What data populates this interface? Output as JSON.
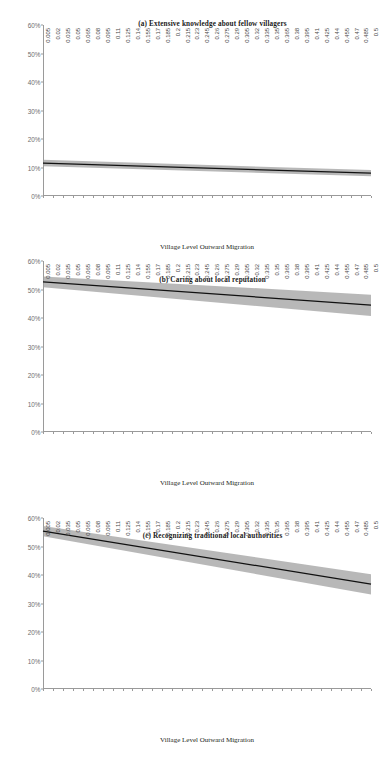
{
  "figure": {
    "panels": [
      {
        "id": "a",
        "title": "(a) Extensive knowledge about fellow villagers",
        "xlabel": "Village Level Outward Migration"
      },
      {
        "id": "b",
        "title": "(b) Caring about local reputation",
        "xlabel": "Village Level Outward Migration"
      },
      {
        "id": "c",
        "title": "(c) Recognizing traditional local authorities",
        "xlabel": "Village Level Outward Migration"
      }
    ],
    "yticks": [
      "0%",
      "10%",
      "20%",
      "30%",
      "40%",
      "50%",
      "60%"
    ],
    "xticks": [
      "0.005",
      "0.02",
      "0.035",
      "0.05",
      "0.065",
      "0.08",
      "0.095",
      "0.11",
      "0.125",
      "0.14",
      "0.155",
      "0.17",
      "0.185",
      "0.2",
      "0.215",
      "0.23",
      "0.245",
      "0.26",
      "0.275",
      "0.29",
      "0.305",
      "0.32",
      "0.335",
      "0.35",
      "0.365",
      "0.38",
      "0.395",
      "0.41",
      "0.425",
      "0.44",
      "0.455",
      "0.47",
      "0.485",
      "0.5"
    ],
    "colors": {
      "line": "#111111",
      "band": "#9d9d9d",
      "axis": "#9a9a9a",
      "tick_label": "#4a4a4a",
      "ytick_label": "#6d6d6d",
      "title": "#1a1a1a",
      "background": "#ffffff"
    }
  },
  "chart_data": [
    {
      "type": "line",
      "panel": "a",
      "title": "(a) Extensive knowledge about fellow villagers",
      "xlabel": "Village Level Outward Migration",
      "ylabel": "",
      "xlim": [
        0.005,
        0.5
      ],
      "ylim": [
        0,
        60
      ],
      "y_unit": "percent",
      "yticks": [
        0,
        10,
        20,
        30,
        40,
        50,
        60
      ],
      "xticks": [
        0.005,
        0.02,
        0.035,
        0.05,
        0.065,
        0.08,
        0.095,
        0.11,
        0.125,
        0.14,
        0.155,
        0.17,
        0.185,
        0.2,
        0.215,
        0.23,
        0.245,
        0.26,
        0.275,
        0.29,
        0.305,
        0.32,
        0.335,
        0.35,
        0.365,
        0.38,
        0.395,
        0.41,
        0.425,
        0.44,
        0.455,
        0.47,
        0.485,
        0.5
      ],
      "grid": false,
      "legend": "none",
      "series": [
        {
          "name": "Predicted probability",
          "x": [
            0.005,
            0.5
          ],
          "values": [
            11.5,
            8.0
          ]
        },
        {
          "name": "95% confidence interval upper",
          "x": [
            0.005,
            0.5
          ],
          "values": [
            12.7,
            9.1
          ]
        },
        {
          "name": "95% confidence interval lower",
          "x": [
            0.005,
            0.5
          ],
          "values": [
            10.4,
            6.9
          ]
        }
      ]
    },
    {
      "type": "line",
      "panel": "b",
      "title": "(b) Caring about local reputation",
      "xlabel": "Village Level Outward Migration",
      "ylabel": "",
      "xlim": [
        0.005,
        0.5
      ],
      "ylim": [
        0,
        60
      ],
      "y_unit": "percent",
      "yticks": [
        0,
        10,
        20,
        30,
        40,
        50,
        60
      ],
      "xticks": [
        0.005,
        0.02,
        0.035,
        0.05,
        0.065,
        0.08,
        0.095,
        0.11,
        0.125,
        0.14,
        0.155,
        0.17,
        0.185,
        0.2,
        0.215,
        0.23,
        0.245,
        0.26,
        0.275,
        0.29,
        0.305,
        0.32,
        0.335,
        0.35,
        0.365,
        0.38,
        0.395,
        0.41,
        0.425,
        0.44,
        0.455,
        0.47,
        0.485,
        0.5
      ],
      "grid": false,
      "legend": "none",
      "series": [
        {
          "name": "Predicted probability",
          "x": [
            0.005,
            0.5
          ],
          "values": [
            52.7,
            44.5
          ]
        },
        {
          "name": "95% confidence interval upper",
          "x": [
            0.005,
            0.5
          ],
          "values": [
            54.6,
            48.2
          ]
        },
        {
          "name": "95% confidence interval lower",
          "x": [
            0.005,
            0.5
          ],
          "values": [
            50.8,
            40.7
          ]
        }
      ]
    },
    {
      "type": "line",
      "panel": "c",
      "title": "(c) Recognizing traditional local authorities",
      "xlabel": "Village Level Outward Migration",
      "ylabel": "",
      "xlim": [
        0.005,
        0.5
      ],
      "ylim": [
        0,
        60
      ],
      "y_unit": "percent",
      "yticks": [
        0,
        10,
        20,
        30,
        40,
        50,
        60
      ],
      "xticks": [
        0.005,
        0.02,
        0.035,
        0.05,
        0.065,
        0.08,
        0.095,
        0.11,
        0.125,
        0.14,
        0.155,
        0.17,
        0.185,
        0.2,
        0.215,
        0.23,
        0.245,
        0.26,
        0.275,
        0.29,
        0.305,
        0.32,
        0.335,
        0.35,
        0.365,
        0.38,
        0.395,
        0.41,
        0.425,
        0.44,
        0.455,
        0.47,
        0.485,
        0.5
      ],
      "grid": false,
      "legend": "none",
      "series": [
        {
          "name": "Predicted probability",
          "x": [
            0.005,
            0.5
          ],
          "values": [
            55.4,
            36.8
          ]
        },
        {
          "name": "95% confidence interval upper",
          "x": [
            0.005,
            0.5
          ],
          "values": [
            57.2,
            40.3
          ]
        },
        {
          "name": "95% confidence interval lower",
          "x": [
            0.005,
            0.5
          ],
          "values": [
            53.6,
            33.2
          ]
        }
      ]
    }
  ]
}
